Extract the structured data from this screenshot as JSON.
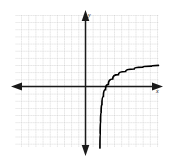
{
  "figure": {
    "kind": "coordinate-plane-graph",
    "background_color": "#ffffff",
    "axis_color": "#1a1a1a",
    "grid_color": "#b4b4b4",
    "grid_minor_color": "#d2d2d2",
    "curve_color": "#000000"
  },
  "labels": {
    "y_axis": "y",
    "x_axis": "x"
  },
  "chart_data": {
    "type": "line",
    "title": "",
    "xlabel": "x",
    "ylabel": "y",
    "grid": true,
    "legend_position": "none",
    "xlim": [
      -10,
      10.5
    ],
    "ylim": [
      -8.7,
      10.2
    ],
    "xtick_step": 1,
    "ytick_step": 1,
    "origin_px": [
      85.5,
      86.5
    ],
    "unit_px": 7.15,
    "axes": {
      "x_axis_arrows": [
        "left",
        "right"
      ],
      "y_axis_arrows": [
        "up",
        "down"
      ],
      "tick_marks": false
    },
    "series": [
      {
        "name": "logarithmic curve",
        "description": "increasing logarithmic curve with vertical asymptote at x = 2",
        "asymptote": {
          "type": "vertical",
          "x": 2
        },
        "x": [
          2.02,
          2.05,
          2.1,
          2.18,
          2.3,
          2.5,
          2.8,
          3.2,
          3.8,
          4.6,
          5.6,
          6.8,
          8.0,
          9.2,
          10.2
        ],
        "y": [
          -8.6,
          -6.6,
          -4.9,
          -3.6,
          -2.5,
          -1.4,
          -0.45,
          0.3,
          1.05,
          1.65,
          2.1,
          2.45,
          2.7,
          2.85,
          2.95
        ]
      }
    ]
  }
}
